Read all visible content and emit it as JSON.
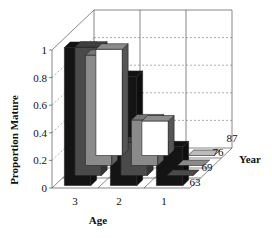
{
  "chart_data": {
    "type": "bar3d",
    "title": "",
    "ylabel": "Proportion Mature",
    "xlabel": "Age",
    "zlabel": "Year",
    "ylim": [
      0,
      1
    ],
    "yticks": [
      "0",
      "0.2",
      "0.4",
      "0.6",
      "0.8",
      "1"
    ],
    "categories": [
      "3",
      "2",
      "1"
    ],
    "series": [
      {
        "name": "63",
        "color": "#ffffff",
        "values": [
          0.77,
          0.25,
          0.0
        ]
      },
      {
        "name": "69",
        "color": "#8a8a8a",
        "values": [
          0.8,
          0.33,
          0.0
        ]
      },
      {
        "name": "76",
        "color": "#4a4a4a",
        "values": [
          0.93,
          0.24,
          0.0
        ]
      },
      {
        "name": "87",
        "color": "#141414",
        "values": [
          1.0,
          0.79,
          0.28
        ]
      }
    ],
    "grid": true
  },
  "labels": {
    "y_axis": "Proportion Mature",
    "x_axis": "Age",
    "z_axis": "Year",
    "ages": [
      "3",
      "2",
      "1"
    ],
    "years": [
      "87",
      "76",
      "69",
      "63"
    ],
    "yticks": [
      "0",
      "0.2",
      "0.4",
      "0.6",
      "0.8",
      "1"
    ]
  }
}
